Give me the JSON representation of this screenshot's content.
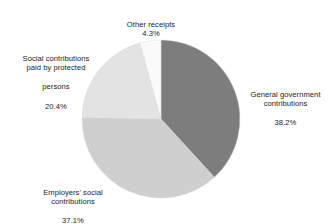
{
  "chart_data": {
    "type": "pie",
    "title": "",
    "subtitle": "",
    "xlabel": "",
    "ylabel": "",
    "legend_position": "none",
    "grid": false,
    "units": "percent",
    "start_angle_deg": 0,
    "direction": "clockwise",
    "categories": [
      "General government contributions",
      "Employers' social contributions",
      "Social contributions paid by protected persons",
      "Other receipts"
    ],
    "values": [
      38.2,
      37.1,
      20.4,
      4.3
    ],
    "colors": [
      "#7d7d7d",
      "#cfcfcf",
      "#e3e3e3",
      "#fafafa"
    ],
    "slices": [
      {
        "name": "General government contributions",
        "label_line1": "General government",
        "label_line2": "contributions",
        "value": 38.2,
        "value_text": "38.2%",
        "color": "#7d7d7d"
      },
      {
        "name": "Employers' social contributions",
        "label_line1": "Employers' social",
        "label_line2": "contributions",
        "value": 37.1,
        "value_text": "37.1%",
        "color": "#cfcfcf"
      },
      {
        "name": "Social contributions paid by protected persons",
        "label_line1": "Social contributions",
        "label_line2": "paid by protected",
        "label_line3": "persons",
        "value": 20.4,
        "value_text": "20.4%",
        "color": "#e3e3e3"
      },
      {
        "name": "Other receipts",
        "label_line1": "Other receipts",
        "value": 4.3,
        "value_text": "4.3%",
        "color": "#fafafa"
      }
    ]
  },
  "geometry": {
    "center_x": 161,
    "center_y": 119,
    "radius": 79
  },
  "style": {
    "background": "#ffffff",
    "text_color": "#1c1c1c",
    "slice_outline": "#d6d6d6"
  }
}
